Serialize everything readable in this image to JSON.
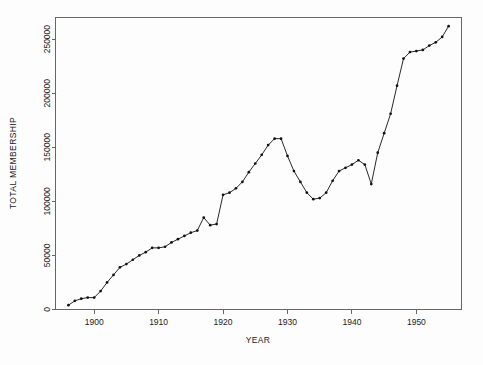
{
  "chart_data": {
    "type": "line",
    "title": "",
    "xlabel": "YEAR",
    "ylabel": "TOTAL MEMBERSHIP",
    "xlim": [
      1894,
      1957
    ],
    "ylim": [
      0,
      270000
    ],
    "grid": false,
    "legend": null,
    "xticks": [
      1900,
      1910,
      1920,
      1930,
      1940,
      1950
    ],
    "xtick_labels": [
      "1900",
      "1910",
      "1920",
      "1930",
      "1940",
      "1950"
    ],
    "yticks": [
      0,
      50000,
      100000,
      150000,
      200000,
      250000
    ],
    "ytick_labels": [
      "0",
      "50000",
      "100000",
      "150000",
      "200000",
      "250000"
    ],
    "marker": "filled-circle",
    "line_color": "#111111",
    "series": [
      {
        "name": "Total membership",
        "x": [
          1896,
          1897,
          1898,
          1899,
          1900,
          1901,
          1902,
          1903,
          1904,
          1905,
          1906,
          1907,
          1908,
          1909,
          1910,
          1911,
          1912,
          1913,
          1914,
          1915,
          1916,
          1917,
          1918,
          1919,
          1920,
          1921,
          1922,
          1923,
          1924,
          1925,
          1926,
          1927,
          1928,
          1929,
          1930,
          1931,
          1932,
          1933,
          1934,
          1935,
          1936,
          1937,
          1938,
          1939,
          1940,
          1941,
          1942,
          1943,
          1944,
          1945,
          1946,
          1947,
          1948,
          1949,
          1950,
          1951,
          1952,
          1953,
          1954,
          1955
        ],
        "values": [
          4000,
          8000,
          10000,
          11000,
          11000,
          17000,
          25000,
          32000,
          39000,
          42000,
          46000,
          50000,
          53000,
          57000,
          57000,
          58000,
          62000,
          65000,
          68000,
          71000,
          73000,
          85000,
          78000,
          79000,
          106000,
          108000,
          112000,
          118000,
          127000,
          135000,
          143000,
          152000,
          158000,
          158000,
          142000,
          128000,
          118000,
          108000,
          102000,
          103000,
          108000,
          119000,
          128000,
          131000,
          134000,
          138000,
          134000,
          116000,
          145000,
          163000,
          181000,
          207000,
          232000,
          238000,
          239000,
          240000,
          244000,
          247000,
          252000,
          262000
        ]
      }
    ]
  },
  "axes": {
    "x_title": "YEAR",
    "y_title": "TOTAL MEMBERSHIP"
  }
}
